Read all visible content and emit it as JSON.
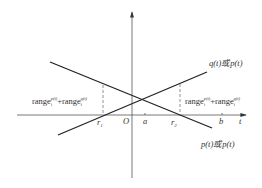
{
  "diagram": {
    "axes": {
      "horizontal_label": "t",
      "origin_label": "O"
    },
    "ticks": {
      "r1": "r",
      "r1_sub": "1",
      "a": "a",
      "r2": "r",
      "r2_sub": "2",
      "b": "b"
    },
    "lines": {
      "upper_label": "q(t)或p(t)",
      "lower_label": "p(t)或p(t)"
    },
    "annotations": {
      "left": {
        "term1": "range",
        "term1_sub": "i",
        "term1_sup": "p(t)",
        "plus": "+",
        "term2": "range",
        "term2_sub": "i",
        "term2_sup": "q(t)"
      },
      "right": {
        "term1": "range",
        "term1_sub": "i",
        "term1_sup": "p(t)",
        "plus": "+",
        "term2": "range",
        "term2_sub": "i",
        "term2_sup": "q(t)"
      }
    },
    "colors": {
      "line": "#222222",
      "axis": "#555555",
      "dashed": "#777777"
    }
  }
}
